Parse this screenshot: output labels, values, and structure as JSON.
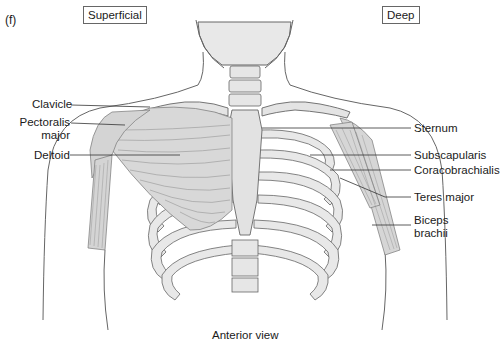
{
  "figure": {
    "panel_label": "(f)",
    "view_labels": {
      "left": "Superficial",
      "right": "Deep"
    },
    "caption": "Anterior view"
  },
  "labels": {
    "left": [
      {
        "text": "Clavicle"
      },
      {
        "text": "Pectoralis\nmajor",
        "line1": "Pectoralis",
        "line2": "major"
      },
      {
        "text": "Deltoid"
      }
    ],
    "right": [
      {
        "text": "Sternum"
      },
      {
        "text": "Subscapularis"
      },
      {
        "text": "Coracobrachialis"
      },
      {
        "text": "Teres major"
      },
      {
        "text": "Biceps\nbrachii",
        "line1": "Biceps",
        "line2": "brachii"
      }
    ]
  },
  "colors": {
    "line": "#555555",
    "bone_fill": "#e6e6e6",
    "muscle_fill": "#d4d4d4",
    "leader": "#333333"
  }
}
